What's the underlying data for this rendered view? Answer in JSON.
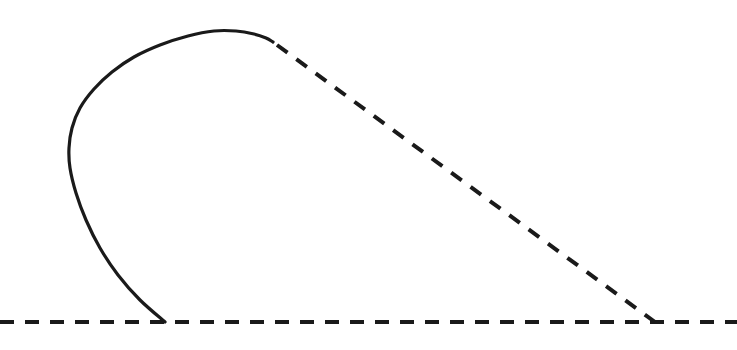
{
  "figure": {
    "title": "",
    "background_color": "#ffffff",
    "stroke_color": "#1a1a1a",
    "width": 737,
    "height": 350
  },
  "chart_data": {
    "type": "line",
    "title": "",
    "subtitle": "",
    "xlabel": "",
    "ylabel": "",
    "xlim": [
      0,
      737
    ],
    "ylim": [
      350,
      0
    ],
    "grid": false,
    "legend": "none",
    "axis_visible": false,
    "tick_labels_x": [],
    "tick_labels_y": [],
    "annotations": [],
    "series": [
      {
        "name": "baseline",
        "style": "dashed",
        "color": "#1a1a1a",
        "stroke_width": 4,
        "dash_length": 14,
        "dash_gap": 11,
        "points": [
          [
            0,
            322
          ],
          [
            737,
            322
          ]
        ]
      },
      {
        "name": "solid-loop-curve",
        "style": "solid",
        "color": "#1a1a1a",
        "stroke_width": 3.2,
        "description": "teardrop loop rising from baseline, bulging left, over the top, ending at upper right",
        "points": [
          [
            165,
            322
          ],
          [
            140,
            300
          ],
          [
            118,
            275
          ],
          [
            100,
            248
          ],
          [
            86,
            220
          ],
          [
            76,
            193
          ],
          [
            70,
            168
          ],
          [
            69,
            148
          ],
          [
            72,
            128
          ],
          [
            80,
            108
          ],
          [
            94,
            89
          ],
          [
            112,
            72
          ],
          [
            134,
            57
          ],
          [
            160,
            45
          ],
          [
            188,
            36
          ],
          [
            214,
            31
          ],
          [
            236,
            31
          ],
          [
            254,
            34
          ],
          [
            266,
            38
          ],
          [
            273,
            42
          ]
        ]
      },
      {
        "name": "dashed-diagonal",
        "style": "dashed",
        "color": "#1a1a1a",
        "stroke_width": 4,
        "dash_length": 13,
        "dash_gap": 11,
        "points": [
          [
            277,
            45
          ],
          [
            655,
            322
          ]
        ]
      }
    ]
  }
}
